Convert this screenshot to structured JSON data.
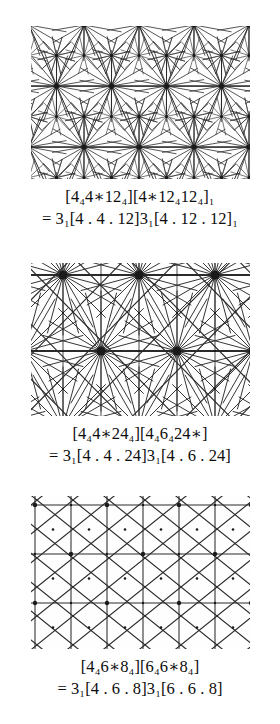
{
  "page": {
    "background": "#ffffff",
    "ink": "#111111",
    "width": 280,
    "height": 724
  },
  "figures": [
    {
      "id": "figure-1",
      "diagram_name": "tiling-diagram-1",
      "caption_bracket": "[4₄4∗12₄][4∗12₄12₄]₁",
      "caption_bracket_plain": "[4o4*12o][4*12o12o]1",
      "caption_equation": "= 3₁[4 . 4 . 12]3₁[4 . 12 . 12]₁",
      "caption_equation_plain": "= 3_1[4.4.12]3_1[4.12.12]_1",
      "vertex_types": [
        "4.4.12",
        "4.12.12"
      ],
      "symmetry_prefix": "3",
      "symmetry_subscript": "1",
      "lattice": {
        "kind": "triangulated",
        "hub_valence": 18,
        "node_valence": 12
      }
    },
    {
      "id": "figure-2",
      "diagram_name": "tiling-diagram-2",
      "caption_bracket": "[4₄4∗24₄][4₄6₄24∗]",
      "caption_bracket_plain": "[4o4*24o][4o6o24*]",
      "caption_equation": "= 3₁[4 . 4 . 24]3₁[4 . 6 . 24]",
      "caption_equation_plain": "= 3_1[4.4.24]3_1[4.6.24]",
      "vertex_types": [
        "4.4.24",
        "4.6.24"
      ],
      "symmetry_prefix": "3",
      "symmetry_subscript": "1",
      "lattice": {
        "kind": "radial-burst",
        "hub_valence": 24,
        "node_valence": 6
      }
    },
    {
      "id": "figure-3",
      "diagram_name": "tiling-diagram-3",
      "caption_bracket": "[4₄6∗8₄][6₄6∗8₄]",
      "caption_bracket_plain": "[4o6*8o][6o6*8o]",
      "caption_equation": "= 3₁[4 . 6 . 8]3₁[6 . 6 . 8]",
      "caption_equation_plain": "= 3_1[4.6.8]3_1[6.6.8]",
      "vertex_types": [
        "4.6.8",
        "6.6.8"
      ],
      "symmetry_prefix": "3",
      "symmetry_subscript": "1",
      "lattice": {
        "kind": "grid-diagonal",
        "hub_valence": 8,
        "node_valence": 6
      }
    }
  ],
  "glyphs": {
    "circle_sub": "ₒ",
    "star_sub": "∗",
    "one_sub": "₁",
    "dot": "."
  }
}
